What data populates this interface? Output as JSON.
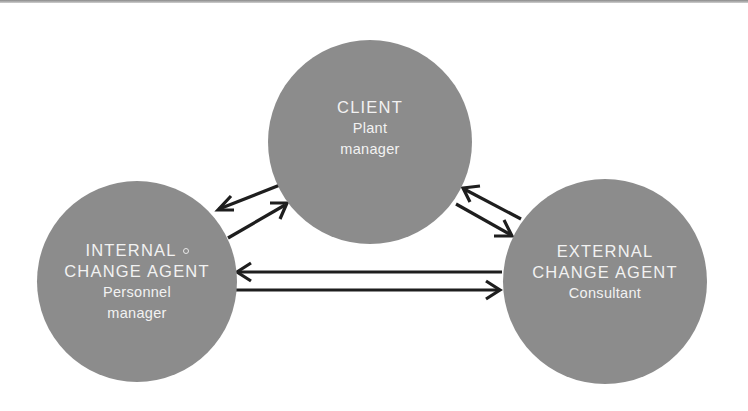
{
  "diagram": {
    "type": "relationship-triangle",
    "nodes": {
      "client": {
        "role": "CLIENT",
        "person_lines": [
          "Plant",
          "manager"
        ]
      },
      "internal": {
        "role_lines": [
          "INTERNAL",
          "CHANGE AGENT"
        ],
        "person_lines": [
          "Personnel",
          "manager"
        ]
      },
      "external": {
        "role_lines": [
          "EXTERNAL",
          "CHANGE AGENT"
        ],
        "person_lines": [
          "Consultant"
        ]
      }
    },
    "edges": [
      {
        "from": "client",
        "to": "internal",
        "style": "arrow"
      },
      {
        "from": "internal",
        "to": "client",
        "style": "arrow"
      },
      {
        "from": "external",
        "to": "client",
        "style": "arrow"
      },
      {
        "from": "client",
        "to": "external",
        "style": "arrow"
      },
      {
        "from": "external",
        "to": "internal",
        "style": "arrow"
      },
      {
        "from": "internal",
        "to": "external",
        "style": "arrow"
      }
    ],
    "colors": {
      "node_fill": "#8c8c8c",
      "node_text": "#f2f2f2",
      "arrow": "#1e1e1e",
      "background": "#ffffff"
    }
  }
}
